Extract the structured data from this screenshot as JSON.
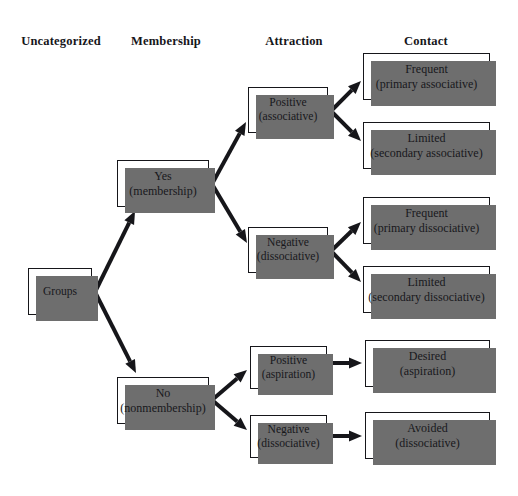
{
  "diagram": {
    "background_color": "#ffffff",
    "box_fill_color": "#ffffff",
    "box_border_color": "#16161a",
    "box_shadow_color": "#6e6e6e",
    "arrow_color": "#16161a",
    "columns": [
      {
        "id": "uncategorized",
        "label": "Uncategorized",
        "x": 61,
        "y": 34
      },
      {
        "id": "membership",
        "label": "Membership",
        "x": 166,
        "y": 34
      },
      {
        "id": "attraction",
        "label": "Attraction",
        "x": 294,
        "y": 34
      },
      {
        "id": "contact",
        "label": "Contact",
        "x": 426,
        "y": 34
      }
    ],
    "nodes": [
      {
        "id": "groups",
        "column": "uncategorized",
        "line1": "Groups",
        "line2": "",
        "x": 28,
        "y": 268,
        "w": 64,
        "h": 47
      },
      {
        "id": "yes-membership",
        "column": "membership",
        "line1": "Yes",
        "line2": "(membership)",
        "x": 117,
        "y": 160,
        "w": 92,
        "h": 47
      },
      {
        "id": "no-nonmembership",
        "column": "membership",
        "line1": "No",
        "line2": "(nonmembership)",
        "x": 117,
        "y": 377,
        "w": 92,
        "h": 47
      },
      {
        "id": "positive-associative",
        "column": "attraction",
        "line1": "Positive",
        "line2": "(associative)",
        "x": 248,
        "y": 87,
        "w": 80,
        "h": 46
      },
      {
        "id": "negative-dissociative",
        "column": "attraction",
        "line1": "Negative",
        "line2": "(dissociative)",
        "x": 248,
        "y": 227,
        "w": 80,
        "h": 46
      },
      {
        "id": "positive-aspiration",
        "column": "attraction",
        "line1": "Positive",
        "line2": "(aspiration)",
        "x": 250,
        "y": 346,
        "w": 77,
        "h": 43
      },
      {
        "id": "negative-dissociative-2",
        "column": "attraction",
        "line1": "Negative",
        "line2": "(dissociative)",
        "x": 250,
        "y": 415,
        "w": 77,
        "h": 43
      },
      {
        "id": "frequent-primary-associative",
        "column": "contact",
        "line1": "Frequent",
        "line2": "(primary associative)",
        "x": 363,
        "y": 53,
        "w": 127,
        "h": 47
      },
      {
        "id": "limited-secondary-associative",
        "column": "contact",
        "line1": "Limited",
        "line2": "(secondary associative)",
        "x": 363,
        "y": 122,
        "w": 127,
        "h": 47
      },
      {
        "id": "frequent-primary-dissociative",
        "column": "contact",
        "line1": "Frequent",
        "line2": "(primary dissociative)",
        "x": 363,
        "y": 197,
        "w": 127,
        "h": 47
      },
      {
        "id": "limited-secondary-dissociative",
        "column": "contact",
        "line1": "Limited",
        "line2": "(secondary dissociative)",
        "x": 363,
        "y": 266,
        "w": 127,
        "h": 47
      },
      {
        "id": "desired-aspiration",
        "column": "contact",
        "line1": "Desired",
        "line2": "(aspiration)",
        "x": 365,
        "y": 340,
        "w": 125,
        "h": 47
      },
      {
        "id": "avoided-dissociative",
        "column": "contact",
        "line1": "Avoided",
        "line2": "(dissociative)",
        "x": 365,
        "y": 412,
        "w": 125,
        "h": 47
      }
    ],
    "edges": [
      {
        "id": "groups-to-yes",
        "from": "groups",
        "to": "yes-membership",
        "x1": 95,
        "y1": 292,
        "x2": 135,
        "y2": 211
      },
      {
        "id": "groups-to-no",
        "from": "groups",
        "to": "no-nonmembership",
        "x1": 95,
        "y1": 292,
        "x2": 136,
        "y2": 373
      },
      {
        "id": "yes-to-positive-associative",
        "from": "yes-membership",
        "to": "positive-associative",
        "x1": 212,
        "y1": 184,
        "x2": 246,
        "y2": 122
      },
      {
        "id": "yes-to-negative-dissociative",
        "from": "yes-membership",
        "to": "negative-dissociative",
        "x1": 212,
        "y1": 184,
        "x2": 247,
        "y2": 243
      },
      {
        "id": "positive-assoc-to-frequent",
        "from": "positive-associative",
        "to": "frequent-primary-associative",
        "x1": 331,
        "y1": 111,
        "x2": 361,
        "y2": 81
      },
      {
        "id": "positive-assoc-to-limited",
        "from": "positive-associative",
        "to": "limited-secondary-associative",
        "x1": 331,
        "y1": 111,
        "x2": 361,
        "y2": 141
      },
      {
        "id": "negative-dissoc-to-frequent",
        "from": "negative-dissociative",
        "to": "frequent-primary-dissociative",
        "x1": 331,
        "y1": 251,
        "x2": 361,
        "y2": 222
      },
      {
        "id": "negative-dissoc-to-limited",
        "from": "negative-dissociative",
        "to": "limited-secondary-dissociative",
        "x1": 331,
        "y1": 251,
        "x2": 361,
        "y2": 282
      },
      {
        "id": "no-to-positive-aspiration",
        "from": "no-nonmembership",
        "to": "positive-aspiration",
        "x1": 212,
        "y1": 400,
        "x2": 247,
        "y2": 370
      },
      {
        "id": "no-to-negative-dissociative-2",
        "from": "no-nonmembership",
        "to": "negative-dissociative-2",
        "x1": 212,
        "y1": 400,
        "x2": 247,
        "y2": 430
      },
      {
        "id": "positive-aspiration-to-desired",
        "from": "positive-aspiration",
        "to": "desired-aspiration",
        "x1": 331,
        "y1": 363,
        "x2": 362,
        "y2": 363
      },
      {
        "id": "negative-dissoc-2-to-avoided",
        "from": "negative-dissociative-2",
        "to": "avoided-dissociative",
        "x1": 331,
        "y1": 436,
        "x2": 362,
        "y2": 436
      }
    ]
  }
}
